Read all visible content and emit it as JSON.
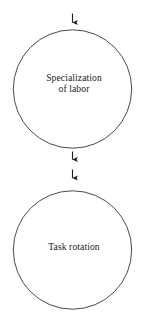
{
  "diagram": {
    "type": "flow-diagram",
    "background_color": "#ffffff",
    "stroke_color": "#262626",
    "text_color": "#1a1a1a",
    "nodes": [
      {
        "id": "specialization-of-labor",
        "shape": "circle",
        "label": "Specialization\nof labor",
        "label_line_1": "Specialization",
        "label_line_2": "of labor",
        "cx": 72.5,
        "cy": 89,
        "r": 59.5
      },
      {
        "id": "task-rotation",
        "shape": "circle",
        "label": "Task rotation",
        "label_line_1": "Task rotation",
        "cx": 72.5,
        "cy": 250,
        "r": 59.5
      }
    ],
    "arrows": [
      {
        "id": "arrow-into-specialization",
        "direction": "down",
        "x": 72.5,
        "y_start": 13,
        "y_end": 27,
        "target": "specialization-of-labor"
      },
      {
        "id": "arrow-out-of-specialization",
        "direction": "down",
        "x": 72.5,
        "y_start": 151,
        "y_end": 164,
        "source": "specialization-of-labor"
      },
      {
        "id": "arrow-into-task-rotation",
        "direction": "down",
        "x": 72.5,
        "y_start": 169,
        "y_end": 183,
        "target": "task-rotation"
      }
    ]
  }
}
